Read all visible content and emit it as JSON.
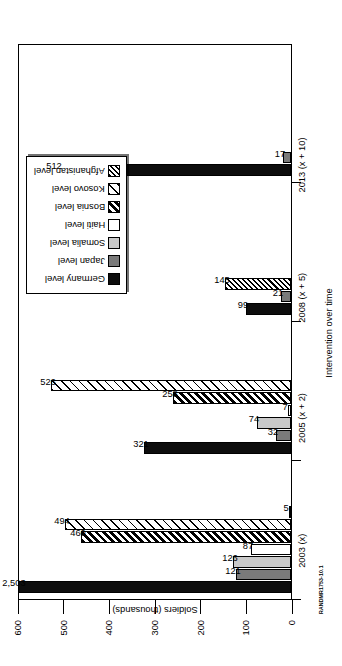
{
  "source_id": "RANDMR1753-10.1",
  "chart_data": {
    "type": "bar",
    "title": "",
    "xlabel": "Intervention over time",
    "ylabel": "Soldiers (thousands)",
    "ylim": [
      0,
      600
    ],
    "yticks": [
      0,
      100,
      200,
      300,
      400,
      500,
      600
    ],
    "grid": false,
    "legend_position": "top-right",
    "categories": [
      "2003 (x)",
      "2005 (x + 2)",
      "2008 (x + 5)",
      "2013 (x + 10)"
    ],
    "series": [
      {
        "name": "Germany level",
        "swatch": "sw-germany",
        "values": [
          2503,
          321,
          99,
          512
        ],
        "labels": [
          "2,503",
          "321",
          "99",
          "512"
        ]
      },
      {
        "name": "Japan level",
        "swatch": "sw-japan",
        "values": [
          121,
          32,
          21,
          17
        ],
        "labels": [
          "121",
          "32",
          "21",
          "17"
        ]
      },
      {
        "name": "Somalia level",
        "swatch": "sw-somalia",
        "values": [
          126,
          74,
          null,
          null
        ],
        "labels": [
          "126",
          "74",
          "",
          ""
        ]
      },
      {
        "name": "Haiti level",
        "swatch": "sw-haiti",
        "values": [
          87,
          7,
          null,
          null
        ],
        "labels": [
          "87",
          "7",
          "",
          ""
        ]
      },
      {
        "name": "Bosnia level",
        "swatch": "sw-bosnia",
        "values": [
          460,
          258,
          null,
          null
        ],
        "labels": [
          "460",
          "258",
          "",
          ""
        ]
      },
      {
        "name": "Kosovo level",
        "swatch": "sw-kosovo",
        "values": [
          494,
          526,
          null,
          null
        ],
        "labels": [
          "494",
          "526",
          "",
          ""
        ]
      },
      {
        "name": "Afghanistan level",
        "swatch": "sw-afghanistan",
        "values": [
          5,
          null,
          145,
          null
        ],
        "labels": [
          "5",
          "",
          "145",
          ""
        ]
      }
    ]
  }
}
